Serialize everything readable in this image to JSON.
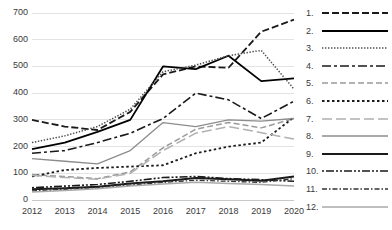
{
  "chart_data": {
    "type": "line",
    "title": "",
    "xlabel": "",
    "ylabel": "",
    "x": [
      2012,
      2013,
      2014,
      2015,
      2016,
      2017,
      2018,
      2019,
      2020
    ],
    "ylim": [
      0,
      700
    ],
    "yticks": [
      0,
      100,
      200,
      300,
      400,
      500,
      600,
      700
    ],
    "ytick_labels": [
      "0",
      "100",
      "200",
      "300",
      "400",
      "500",
      "600",
      "700"
    ],
    "xtick_labels": [
      "2012",
      "2013",
      "2014",
      "2015",
      "2016",
      "2017",
      "2018",
      "2019",
      "2020"
    ],
    "grid": true,
    "legend_position": "right",
    "series": [
      {
        "name": "1",
        "label": "1.",
        "style": "dashed",
        "color": "#1a1a1a",
        "width": 1.8,
        "dash": "7,3",
        "values": [
          300,
          275,
          262,
          330,
          470,
          500,
          495,
          630,
          675
        ]
      },
      {
        "name": "2",
        "label": "2.",
        "style": "solid",
        "color": "#000000",
        "width": 1.8,
        "dash": "",
        "values": [
          190,
          215,
          255,
          300,
          500,
          490,
          540,
          445,
          455
        ]
      },
      {
        "name": "3",
        "label": "3.",
        "style": "fine-dotted",
        "color": "#4d4d4d",
        "width": 1.5,
        "dash": "1.4,1.6",
        "values": [
          215,
          240,
          275,
          340,
          480,
          505,
          540,
          560,
          415
        ]
      },
      {
        "name": "4",
        "label": "4.",
        "style": "dash-dot",
        "color": "#1a1a1a",
        "width": 1.6,
        "dash": "9,3,3,3",
        "values": [
          175,
          185,
          215,
          250,
          305,
          400,
          375,
          305,
          370
        ]
      },
      {
        "name": "5",
        "label": "5.",
        "style": "gray-dashed",
        "color": "#9a9a9a",
        "width": 1.5,
        "dash": "6,3",
        "values": [
          95,
          88,
          80,
          105,
          195,
          265,
          290,
          270,
          305
        ]
      },
      {
        "name": "6",
        "label": "6.",
        "style": "coarse-dotted",
        "color": "#1a1a1a",
        "width": 1.8,
        "dash": "2.5,2.5",
        "values": [
          88,
          112,
          120,
          125,
          130,
          175,
          200,
          215,
          310
        ]
      },
      {
        "name": "7",
        "label": "7.",
        "style": "gray-long-dash",
        "color": "#b0b0b0",
        "width": 1.5,
        "dash": "10,4",
        "values": [
          92,
          84,
          78,
          100,
          185,
          250,
          275,
          252,
          228
        ]
      },
      {
        "name": "8",
        "label": "8.",
        "style": "thin-solid",
        "color": "#8c8c8c",
        "width": 1.3,
        "dash": "",
        "values": [
          155,
          145,
          135,
          185,
          290,
          275,
          300,
          295,
          305
        ]
      },
      {
        "name": "9",
        "label": "9.",
        "style": "thick-solid",
        "color": "#1a1a1a",
        "width": 2.0,
        "dash": "",
        "values": [
          40,
          44,
          50,
          62,
          70,
          82,
          78,
          72,
          88
        ]
      },
      {
        "name": "10",
        "label": "10.",
        "style": "dash-dot-dot",
        "color": "#1a1a1a",
        "width": 1.6,
        "dash": "2,2,8,2,2,2",
        "values": [
          46,
          52,
          58,
          70,
          84,
          88,
          80,
          76,
          70
        ]
      },
      {
        "name": "11",
        "label": "11.",
        "style": "fine-dash-dot",
        "color": "#333333",
        "width": 1.3,
        "dash": "5,2,1.5,2",
        "values": [
          34,
          40,
          46,
          56,
          66,
          74,
          70,
          66,
          80
        ]
      },
      {
        "name": "12",
        "label": "12.",
        "style": "gray-solid",
        "color": "#aaaaaa",
        "width": 1.5,
        "dash": "",
        "values": [
          30,
          36,
          42,
          52,
          60,
          66,
          62,
          58,
          52
        ]
      }
    ]
  }
}
